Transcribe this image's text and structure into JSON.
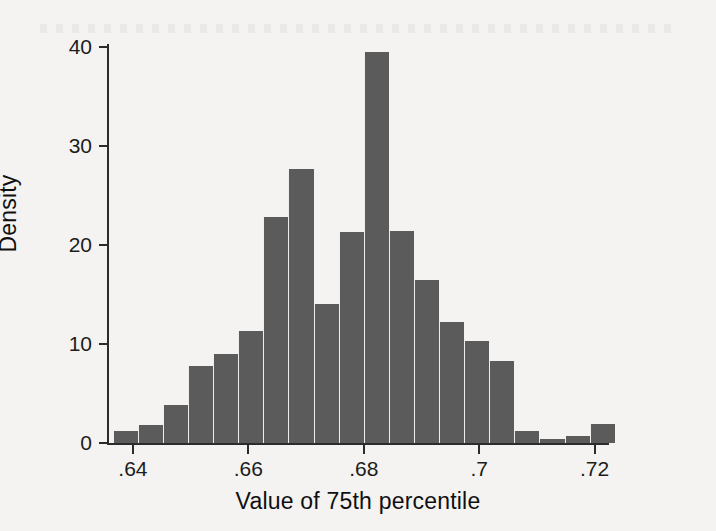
{
  "figure": {
    "background_color": "#f4f3f1",
    "bar_color": "#5b5b5b",
    "axis_color": "#2b2b2b"
  },
  "chart_data": {
    "type": "bar",
    "chart_subtype": "histogram",
    "title": "",
    "xlabel": "Value of 75th percentile",
    "ylabel": "Density",
    "xlim": [
      0.6355,
      0.7225
    ],
    "ylim": [
      0,
      41
    ],
    "grid": false,
    "legend": null,
    "x_ticks": [
      0.64,
      0.66,
      0.68,
      0.7,
      0.72
    ],
    "x_tick_labels": [
      ".64",
      ".66",
      ".68",
      ".7",
      ".72"
    ],
    "y_ticks": [
      0,
      10,
      20,
      30,
      40
    ],
    "y_tick_labels": [
      "0",
      "10",
      "20",
      "30",
      "40"
    ],
    "bin_width": 0.00435,
    "bin_left_edges": [
      0.6365,
      0.64085,
      0.6452,
      0.64955,
      0.6539,
      0.65825,
      0.6626,
      0.66695,
      0.6713,
      0.67565,
      0.68,
      0.68435,
      0.6887,
      0.69305,
      0.6974,
      0.70175,
      0.7061,
      0.71045,
      0.7148,
      0.71915
    ],
    "bin_centers": [
      0.63868,
      0.64303,
      0.64738,
      0.65173,
      0.65608,
      0.66043,
      0.66478,
      0.66913,
      0.67348,
      0.67783,
      0.68218,
      0.68653,
      0.69088,
      0.69523,
      0.69958,
      0.70393,
      0.70828,
      0.71263,
      0.71698,
      0.72133
    ],
    "values": [
      1.2,
      1.8,
      3.8,
      7.8,
      9.0,
      11.3,
      22.8,
      27.7,
      14.0,
      21.3,
      39.5,
      21.4,
      16.5,
      12.2,
      10.3,
      8.3,
      1.2,
      0.4,
      0.7,
      1.9
    ]
  }
}
